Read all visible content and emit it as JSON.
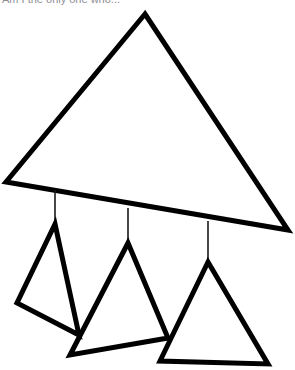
{
  "canvas": {
    "width": 295,
    "height": 370,
    "background_color": "#ffffff",
    "stroke_color": "#000000",
    "thread_color": "#1a1a1a"
  },
  "caption": {
    "text": "Am I the only one who...",
    "color": "#8d8d93",
    "note": "clipped at top edge of image"
  },
  "figure": {
    "main_triangle": {
      "name": "large-triangle",
      "stroke_width": 5,
      "points": "145,14 6,182 288,230",
      "vertices": {
        "apex": [
          145,
          14
        ],
        "left": [
          6,
          182
        ],
        "right": [
          288,
          230
        ]
      }
    },
    "threads": [
      {
        "name": "thread-left",
        "stroke_width": 1.6,
        "x1": 55,
        "y1": 190,
        "x2": 55,
        "y2": 224
      },
      {
        "name": "thread-middle",
        "stroke_width": 1.6,
        "x1": 128,
        "y1": 208,
        "x2": 128,
        "y2": 243
      },
      {
        "name": "thread-right",
        "stroke_width": 1.6,
        "x1": 208,
        "y1": 221,
        "x2": 208,
        "y2": 262
      }
    ],
    "hanging_triangles": [
      {
        "name": "small-triangle-left",
        "stroke_width": 5,
        "points": "55,224 17,303 79,335",
        "vertices": {
          "apex": [
            55,
            224
          ],
          "base_left": [
            17,
            303
          ],
          "base_right": [
            79,
            335
          ]
        }
      },
      {
        "name": "small-triangle-middle",
        "stroke_width": 5,
        "points": "128,243 70,355 168,338",
        "vertices": {
          "apex": [
            128,
            243
          ],
          "base_left": [
            70,
            355
          ],
          "base_right": [
            168,
            338
          ]
        }
      },
      {
        "name": "small-triangle-right",
        "stroke_width": 5,
        "points": "208,262 160,361 268,364",
        "vertices": {
          "apex": [
            208,
            262
          ],
          "base_left": [
            160,
            361
          ],
          "base_right": [
            268,
            364
          ]
        }
      }
    ]
  }
}
